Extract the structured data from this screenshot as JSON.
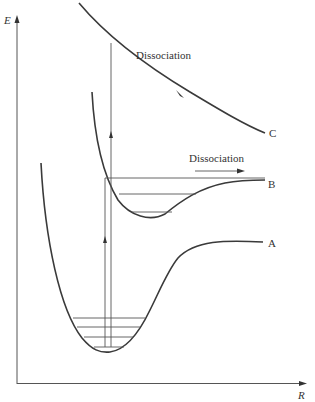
{
  "diagram": {
    "type": "potential-energy-curves",
    "axes": {
      "y_label": "E",
      "x_label": "R"
    },
    "curves": [
      {
        "id": "A",
        "label": "A",
        "description": "bound ground-state potential well with vibrational levels"
      },
      {
        "id": "B",
        "label": "B",
        "description": "bound excited-state potential with shallow well"
      },
      {
        "id": "C",
        "label": "C",
        "description": "repulsive (dissociative) excited state"
      }
    ],
    "annotations": {
      "dissociation_upper": "Dissociation",
      "dissociation_middle": "Dissociation"
    },
    "vibrational_levels_A": 4,
    "vibrational_levels_B": 3,
    "transitions": [
      {
        "from": "A",
        "to": "C",
        "label": "vertical excitation to repulsive state"
      },
      {
        "from": "A",
        "to": "B",
        "label": "vertical excitation above dissociation limit of B"
      }
    ],
    "colors": {
      "line": "#3a3a3a",
      "background": "#ffffff"
    }
  }
}
